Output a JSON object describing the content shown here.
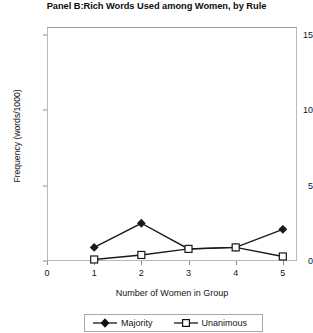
{
  "chart_data": {
    "type": "line",
    "title": "Panel B:Rich Words Used among Women, by Rule",
    "xlabel": "Number of Women in Group",
    "ylabel": "Frequency (words/1000)",
    "x": [
      1,
      2,
      3,
      4,
      5
    ],
    "xlim": [
      0,
      5.3
    ],
    "ylim": [
      0,
      15.5
    ],
    "xticks": [
      0,
      1,
      2,
      3,
      4,
      5
    ],
    "xtick_labels": [
      "0",
      "1",
      "2",
      "3",
      "4",
      "5"
    ],
    "yticks": [
      0,
      5,
      10,
      15
    ],
    "ytick_labels": [
      "0",
      "5",
      "10",
      "15"
    ],
    "grid": false,
    "legend_position": "below-axis-center",
    "series": [
      {
        "name": "Majority",
        "marker": "filled-diamond",
        "color": "#1a1a1a",
        "values": [
          0.9,
          2.5,
          0.8,
          0.9,
          2.1
        ]
      },
      {
        "name": "Unanimous",
        "marker": "open-square",
        "color": "#1a1a1a",
        "values": [
          0.1,
          0.4,
          0.8,
          0.9,
          0.3
        ]
      }
    ]
  },
  "legend": {
    "entries": [
      {
        "label": "Majority"
      },
      {
        "label": "Unanimous"
      }
    ]
  }
}
